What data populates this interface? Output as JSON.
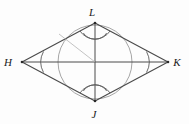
{
  "figure": {
    "name": "rhombus-with-inscribed-circle",
    "background_color": "#fdfdfd",
    "stroke_color": "#3a3a3a",
    "light_stroke_color": "#9a9a9a",
    "labels": {
      "top": "L",
      "left": "H",
      "right": "K",
      "bottom": "J"
    },
    "label_positions": {
      "top": {
        "x": 92,
        "y": 16
      },
      "left": {
        "x": 4,
        "y": 66
      },
      "right": {
        "x": 172,
        "y": 66
      },
      "bottom": {
        "x": 90,
        "y": 118
      }
    },
    "vertices": {
      "L": {
        "x": 95,
        "y": 23
      },
      "H": {
        "x": 22,
        "y": 62
      },
      "K": {
        "x": 168,
        "y": 62
      },
      "J": {
        "x": 95,
        "y": 101
      }
    },
    "inscribed_circle": {
      "cx": 95,
      "cy": 62,
      "r": 37
    },
    "angle_marks": {
      "left_arcs": 1,
      "right_arcs": 1,
      "top_arcs": 2,
      "bottom_arcs": 2
    }
  }
}
